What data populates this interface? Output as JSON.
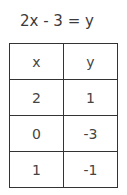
{
  "equation": "2x - 3 = y",
  "table": {
    "headers": [
      "x",
      "y"
    ],
    "rows": [
      [
        "2",
        "1"
      ],
      [
        "0",
        "-3"
      ],
      [
        "1",
        "-1"
      ]
    ]
  }
}
